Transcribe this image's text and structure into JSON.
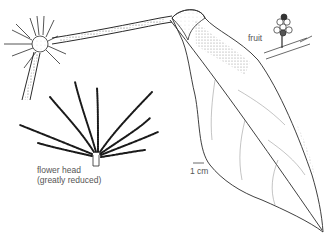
{
  "figure": {
    "labels": {
      "fruit": "fruit",
      "flower_head": "flower head",
      "flower_head_note": "(greatly reduced)",
      "scale": "1 cm"
    }
  },
  "colors": {
    "ink": "#2a2a2a",
    "text": "#555555",
    "background": "#ffffff"
  }
}
